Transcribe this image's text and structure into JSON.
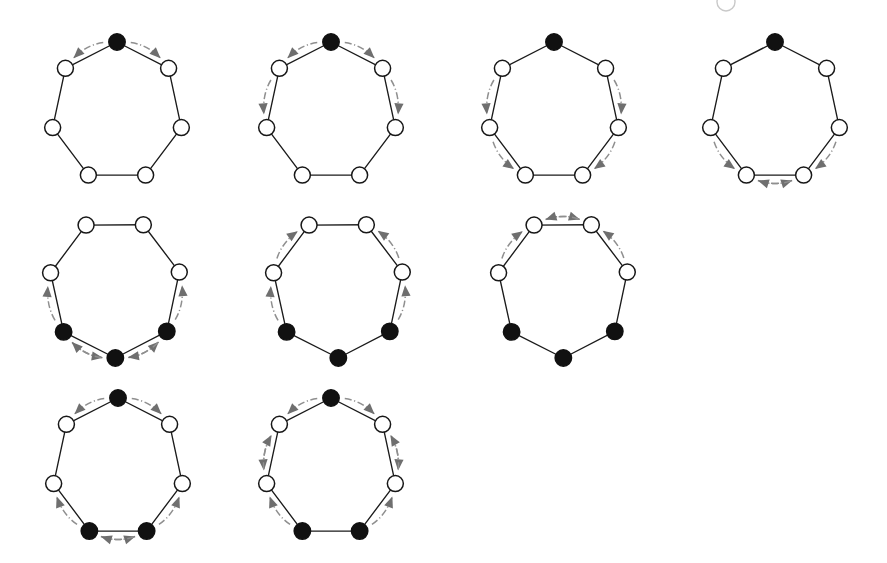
{
  "figure": {
    "background_color": "#ffffff",
    "node_open_color": "#ffffff",
    "node_filled_color": "#111111",
    "edge_color": "#1b1b1b",
    "arc_color": "#8f8f8f",
    "arrow_color": "#6f6f6f",
    "node_count_per_panel": 7,
    "panel_count": 9,
    "rows": 3
  },
  "artifacts": [
    {
      "name": "cut-off-node-top",
      "cx": 726,
      "cy": 2,
      "r": 9
    }
  ],
  "chart_data": {
    "type": "diagram",
    "shape": "heptagon",
    "node_states": [
      "open",
      "filled"
    ],
    "node_angles_deg": [
      270,
      321.43,
      12.86,
      64.29,
      115.71,
      167.14,
      218.57
    ],
    "panels": [
      {
        "id": "panel-1",
        "label": "step 1",
        "row": 0,
        "col": 0,
        "cx": 117,
        "cy": 112,
        "rx": 66,
        "ry": 70,
        "filled_nodes": [
          0
        ],
        "arcs": [
          {
            "from": 0,
            "to": 6,
            "dir": "ccw"
          },
          {
            "from": 0,
            "to": 1,
            "dir": "cw"
          }
        ]
      },
      {
        "id": "panel-2",
        "label": "step 2",
        "row": 0,
        "col": 1,
        "cx": 331,
        "cy": 112,
        "rx": 66,
        "ry": 70,
        "filled_nodes": [
          0
        ],
        "arcs": [
          {
            "from": 0,
            "to": 6,
            "dir": "ccw"
          },
          {
            "from": 0,
            "to": 1,
            "dir": "cw"
          },
          {
            "from": 6,
            "to": 5,
            "dir": "ccw"
          },
          {
            "from": 1,
            "to": 2,
            "dir": "cw"
          }
        ]
      },
      {
        "id": "panel-3",
        "label": "step 3",
        "row": 0,
        "col": 2,
        "cx": 554,
        "cy": 112,
        "rx": 66,
        "ry": 70,
        "filled_nodes": [
          0
        ],
        "arcs": [
          {
            "from": 6,
            "to": 5,
            "dir": "ccw"
          },
          {
            "from": 1,
            "to": 2,
            "dir": "cw"
          },
          {
            "from": 5,
            "to": 4,
            "dir": "ccw"
          },
          {
            "from": 2,
            "to": 3,
            "dir": "cw"
          }
        ]
      },
      {
        "id": "panel-4",
        "label": "step 4",
        "row": 0,
        "col": 3,
        "cx": 775,
        "cy": 112,
        "rx": 66,
        "ry": 70,
        "filled_nodes": [
          0
        ],
        "arcs": [
          {
            "from": 5,
            "to": 4,
            "dir": "ccw"
          },
          {
            "from": 2,
            "to": 3,
            "dir": "cw"
          },
          {
            "from": 4,
            "to": 3,
            "dir": "cw"
          },
          {
            "from": 3,
            "to": 4,
            "dir": "ccw"
          }
        ]
      },
      {
        "id": "panel-5",
        "label": "step 5",
        "row": 1,
        "col": 0,
        "cx": 115,
        "cy": 288,
        "rx": 66,
        "ry": 70,
        "rotation_deg": -26,
        "filled_nodes": [
          5,
          4,
          3
        ],
        "arcs": [
          {
            "from": 5,
            "to": 6,
            "dir": "cw"
          },
          {
            "from": 5,
            "to": 4,
            "dir": "ccw"
          },
          {
            "from": 4,
            "to": 5,
            "dir": "cw"
          },
          {
            "from": 4,
            "to": 3,
            "dir": "ccw"
          },
          {
            "from": 3,
            "to": 4,
            "dir": "cw"
          },
          {
            "from": 3,
            "to": 2,
            "dir": "ccw"
          }
        ]
      },
      {
        "id": "panel-6",
        "label": "step 6",
        "row": 1,
        "col": 1,
        "cx": 338,
        "cy": 288,
        "rx": 66,
        "ry": 70,
        "rotation_deg": -26,
        "filled_nodes": [
          5,
          4,
          3
        ],
        "arcs": [
          {
            "from": 5,
            "to": 6,
            "dir": "cw"
          },
          {
            "from": 6,
            "to": 0,
            "dir": "cw"
          },
          {
            "from": 3,
            "to": 2,
            "dir": "ccw"
          },
          {
            "from": 2,
            "to": 1,
            "dir": "ccw"
          }
        ]
      },
      {
        "id": "panel-7",
        "label": "step 7",
        "row": 1,
        "col": 2,
        "cx": 563,
        "cy": 288,
        "rx": 66,
        "ry": 70,
        "rotation_deg": -26,
        "filled_nodes": [
          5,
          4,
          3
        ],
        "arcs": [
          {
            "from": 6,
            "to": 0,
            "dir": "cw"
          },
          {
            "from": 0,
            "to": 1,
            "dir": "cw"
          },
          {
            "from": 1,
            "to": 0,
            "dir": "ccw"
          },
          {
            "from": 2,
            "to": 1,
            "dir": "ccw"
          }
        ]
      },
      {
        "id": "panel-8",
        "label": "step 8",
        "row": 2,
        "col": 0,
        "cx": 118,
        "cy": 468,
        "rx": 66,
        "ry": 70,
        "filled_nodes": [
          0,
          4,
          3
        ],
        "arcs": [
          {
            "from": 0,
            "to": 6,
            "dir": "ccw"
          },
          {
            "from": 0,
            "to": 1,
            "dir": "cw"
          },
          {
            "from": 4,
            "to": 5,
            "dir": "ccw"
          },
          {
            "from": 4,
            "to": 3,
            "dir": "cw"
          },
          {
            "from": 3,
            "to": 4,
            "dir": "ccw"
          },
          {
            "from": 3,
            "to": 2,
            "dir": "cw"
          }
        ]
      },
      {
        "id": "panel-9",
        "label": "step 9",
        "row": 2,
        "col": 1,
        "cx": 331,
        "cy": 468,
        "rx": 66,
        "ry": 70,
        "filled_nodes": [
          0,
          4,
          3
        ],
        "arcs": [
          {
            "from": 0,
            "to": 6,
            "dir": "ccw"
          },
          {
            "from": 0,
            "to": 1,
            "dir": "cw"
          },
          {
            "from": 6,
            "to": 5,
            "dir": "ccw"
          },
          {
            "from": 1,
            "to": 2,
            "dir": "cw"
          },
          {
            "from": 5,
            "to": 6,
            "dir": "cw"
          },
          {
            "from": 2,
            "to": 1,
            "dir": "ccw"
          },
          {
            "from": 4,
            "to": 5,
            "dir": "ccw"
          },
          {
            "from": 3,
            "to": 2,
            "dir": "cw"
          }
        ]
      }
    ]
  }
}
